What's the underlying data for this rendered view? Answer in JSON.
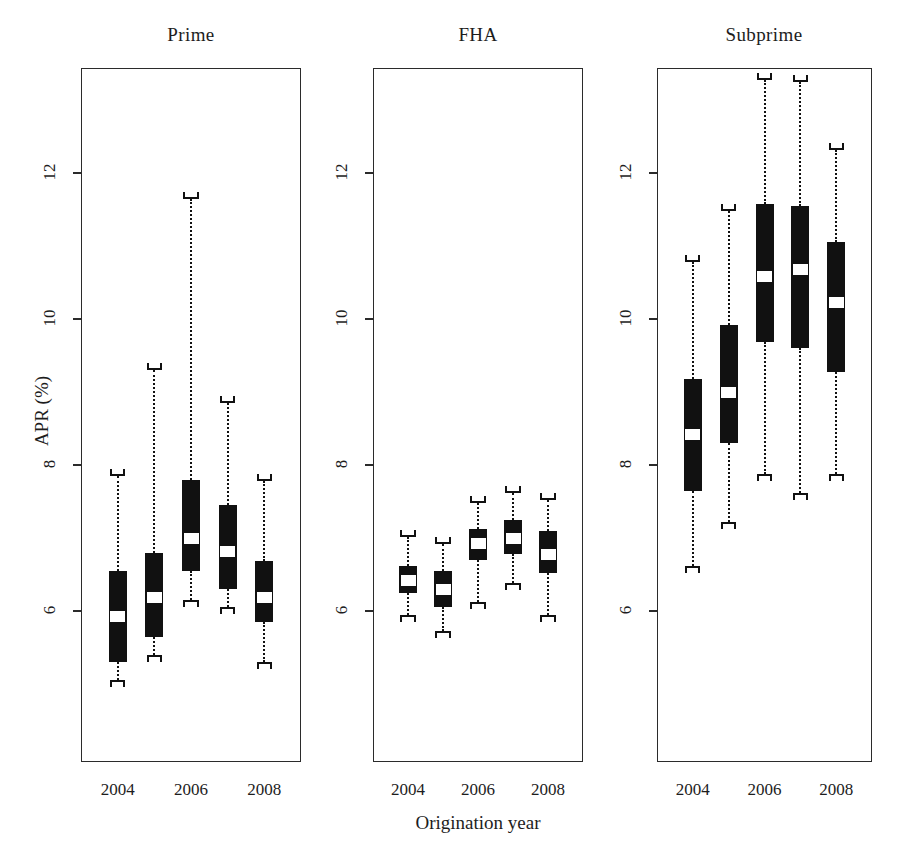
{
  "figure": {
    "y_axis_label": "APR (%)",
    "x_axis_label": "Origination year",
    "y_ticks": [
      "6",
      "8",
      "10",
      "12"
    ],
    "x_ticks": [
      "2004",
      "2006",
      "2008"
    ]
  },
  "chart_data": {
    "type": "box",
    "title": "",
    "xlabel": "Origination year",
    "ylabel": "APR (%)",
    "ylim": [
      4.8,
      13.6
    ],
    "yticks": [
      6,
      8,
      10,
      12
    ],
    "grid": false,
    "legend": "none",
    "categories": [
      "2004",
      "2005",
      "2006",
      "2007",
      "2008"
    ],
    "xtick_labels": [
      "2004",
      "2006",
      "2008"
    ],
    "panels": [
      {
        "name": "Prime",
        "boxes": [
          {
            "year": "2004",
            "whisker_low": 5.05,
            "q1": 5.3,
            "median": 5.92,
            "q3": 6.55,
            "whisker_high": 7.85
          },
          {
            "year": "2005",
            "whisker_low": 5.4,
            "q1": 5.65,
            "median": 6.18,
            "q3": 6.8,
            "whisker_high": 9.3
          },
          {
            "year": "2006",
            "whisker_low": 6.15,
            "q1": 6.55,
            "median": 7.0,
            "q3": 7.8,
            "whisker_high": 11.65
          },
          {
            "year": "2007",
            "whisker_low": 6.05,
            "q1": 6.3,
            "median": 6.82,
            "q3": 7.45,
            "whisker_high": 8.85
          },
          {
            "year": "2008",
            "whisker_low": 5.3,
            "q1": 5.85,
            "median": 6.18,
            "q3": 6.68,
            "whisker_high": 7.78
          }
        ]
      },
      {
        "name": "FHA",
        "boxes": [
          {
            "year": "2004",
            "whisker_low": 5.95,
            "q1": 6.25,
            "median": 6.42,
            "q3": 6.62,
            "whisker_high": 7.02
          },
          {
            "year": "2005",
            "whisker_low": 5.72,
            "q1": 6.05,
            "median": 6.3,
            "q3": 6.55,
            "whisker_high": 6.92
          },
          {
            "year": "2006",
            "whisker_low": 6.12,
            "q1": 6.7,
            "median": 6.92,
            "q3": 7.12,
            "whisker_high": 7.48
          },
          {
            "year": "2007",
            "whisker_low": 6.38,
            "q1": 6.78,
            "median": 7.0,
            "q3": 7.25,
            "whisker_high": 7.62
          },
          {
            "year": "2008",
            "whisker_low": 5.95,
            "q1": 6.52,
            "median": 6.78,
            "q3": 7.1,
            "whisker_high": 7.52
          }
        ]
      },
      {
        "name": "Subprime",
        "boxes": [
          {
            "year": "2004",
            "whisker_low": 6.62,
            "q1": 7.65,
            "median": 8.42,
            "q3": 9.18,
            "whisker_high": 10.78
          },
          {
            "year": "2005",
            "whisker_low": 7.22,
            "q1": 8.3,
            "median": 9.0,
            "q3": 9.92,
            "whisker_high": 11.48
          },
          {
            "year": "2006",
            "whisker_low": 7.88,
            "q1": 9.68,
            "median": 10.58,
            "q3": 11.58,
            "whisker_high": 13.28
          },
          {
            "year": "2007",
            "whisker_low": 7.62,
            "q1": 9.6,
            "median": 10.68,
            "q3": 11.55,
            "whisker_high": 13.25
          },
          {
            "year": "2008",
            "whisker_low": 7.88,
            "q1": 9.28,
            "median": 10.22,
            "q3": 11.05,
            "whisker_high": 12.32
          }
        ]
      }
    ]
  }
}
